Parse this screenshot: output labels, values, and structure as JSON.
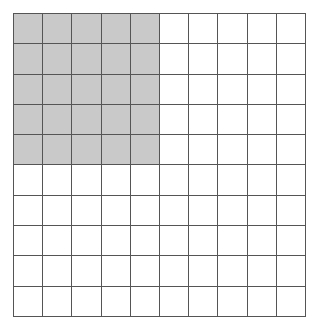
{
  "grid": {
    "rows": 10,
    "cols": 10,
    "shaded": {
      "row_start": 0,
      "row_end": 5,
      "col_start": 0,
      "col_end": 5
    },
    "shaded_count": 25,
    "total_count": 100,
    "colors": {
      "shade": "#c9c9c9",
      "line": "#555555",
      "background": "#ffffff"
    }
  }
}
